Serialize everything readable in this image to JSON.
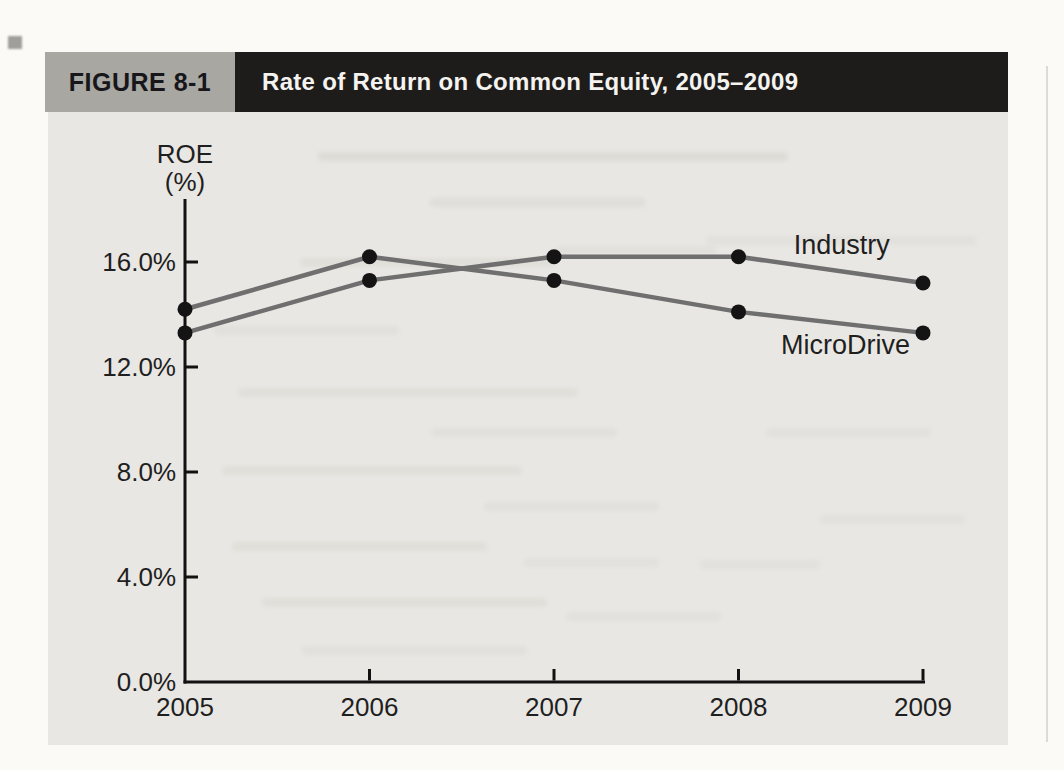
{
  "header": {
    "figure_label": "FIGURE 8-1",
    "title": "Rate of Return on Common Equity, 2005–2009"
  },
  "chart_data": {
    "type": "line",
    "title": "Rate of Return on Common Equity, 2005–2009",
    "ylabel_lines": [
      "ROE",
      "(%)"
    ],
    "xlabel": "",
    "categories": [
      2005,
      2006,
      2007,
      2008,
      2009
    ],
    "series": [
      {
        "name": "Industry",
        "values": [
          13.3,
          15.3,
          16.2,
          16.2,
          15.2
        ],
        "label_anchor": {
          "year": 2008.56,
          "value": 16.3
        }
      },
      {
        "name": "MicroDrive",
        "values": [
          14.2,
          16.2,
          15.3,
          14.1,
          13.3
        ],
        "label_anchor": {
          "year": 2008.58,
          "value": 12.5
        }
      }
    ],
    "y_ticks": [
      {
        "value": 0,
        "label": "0.0%"
      },
      {
        "value": 4,
        "label": "4.0%"
      },
      {
        "value": 8,
        "label": "8.0%"
      },
      {
        "value": 12,
        "label": "12.0%"
      },
      {
        "value": 16,
        "label": "16.0%"
      }
    ],
    "ylim": [
      0,
      18.4
    ],
    "grid": false,
    "legend_position": "inline-labels",
    "line_color": "#6f6f6f",
    "marker_color": "#141414",
    "axis_color": "#111111"
  },
  "colors": {
    "figure_label_bg": "#a8a7a2",
    "title_bar_bg": "#1d1c1a",
    "title_text": "#f4f3f0",
    "figure_bg": "#e9e7e3",
    "page_bg": "#fbfaf7"
  }
}
